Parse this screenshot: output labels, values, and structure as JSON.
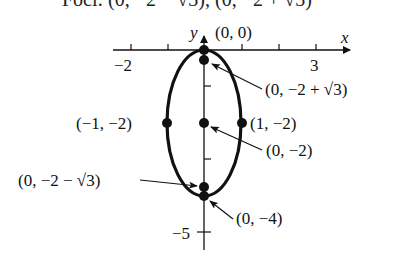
{
  "caption": {
    "text": "Foci: (0, −2 − √3), (0, −2 + √3)",
    "clipped": true
  },
  "axes": {
    "x_label": "x",
    "y_label": "y",
    "x_tick_labels": [
      {
        "value": -2,
        "label": "−2"
      },
      {
        "value": 3,
        "label": "3"
      }
    ],
    "y_tick_labels": [
      {
        "value": -5,
        "label": "−5"
      }
    ]
  },
  "ellipse": {
    "center": [
      0,
      -2
    ],
    "semi_major_vertical": 2,
    "semi_minor_horizontal": 1
  },
  "points": [
    {
      "id": "vertex-top",
      "coords": [
        0,
        0
      ],
      "label": "(0, 0)"
    },
    {
      "id": "focus-upper",
      "coords": [
        0,
        -0.268
      ],
      "label": "(0, −2 + √3)"
    },
    {
      "id": "covertex-left",
      "coords": [
        -1,
        -2
      ],
      "label": "(−1, −2)"
    },
    {
      "id": "center",
      "coords": [
        0,
        -2
      ],
      "label": "(0, −2)"
    },
    {
      "id": "covertex-right",
      "coords": [
        1,
        -2
      ],
      "label": "(1, −2)"
    },
    {
      "id": "focus-lower",
      "coords": [
        0,
        -3.732
      ],
      "label": "(0, −2 − √3)"
    },
    {
      "id": "vertex-bottom",
      "coords": [
        0,
        -4
      ],
      "label": "(0, −4)"
    }
  ],
  "labels": {
    "origin": "(0, 0)",
    "focus_upper": "(0, −2 + √3)",
    "covertex_left": "(−1, −2)",
    "covertex_right": "(1, −2)",
    "center": "(0, −2)",
    "focus_lower": "(0, −2 − √3)",
    "vertex_bottom": "(0, −4)",
    "x_axis": "x",
    "y_axis": "y",
    "x_tick_neg2": "−2",
    "x_tick_3": "3",
    "y_tick_neg5": "−5"
  }
}
